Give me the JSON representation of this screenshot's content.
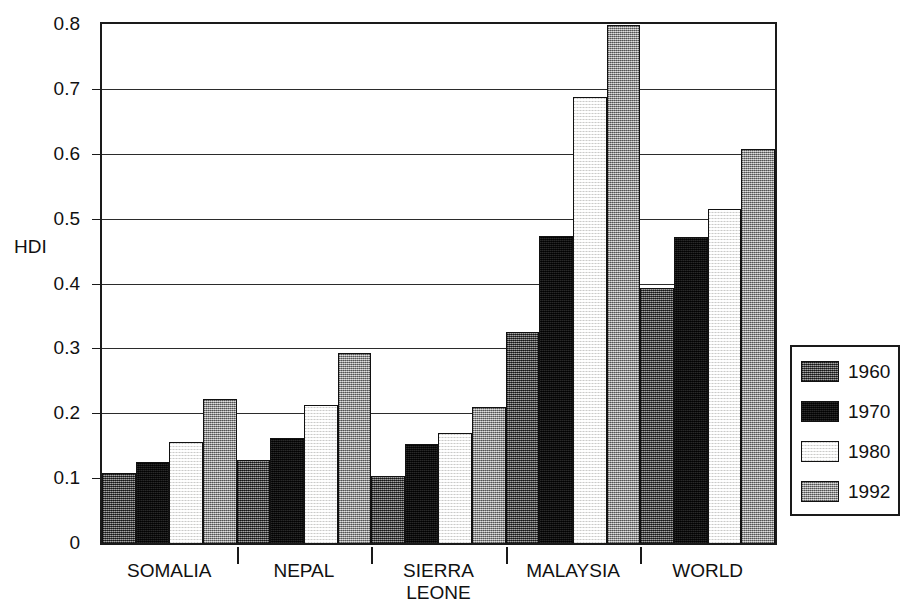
{
  "chart_data": {
    "type": "bar",
    "title": "",
    "xlabel": "",
    "ylabel": "HDI",
    "ylim": [
      0,
      0.8
    ],
    "ytick_labels": [
      "0.8",
      "0.7",
      "0.6",
      "0.5",
      "0.4",
      "0.3",
      "0.2",
      "0.1",
      "0"
    ],
    "ytick_values": [
      0.8,
      0.7,
      0.6,
      0.5,
      0.4,
      0.3,
      0.2,
      0.1,
      0
    ],
    "grid": true,
    "legend_position": "right-outside",
    "categories": [
      "SOMALIA",
      "NEPAL",
      "SIERRA LEONE",
      "MALAYSIA",
      "WORLD"
    ],
    "series": [
      {
        "name": "1960",
        "color": "#565656",
        "values": [
          0.108,
          0.128,
          0.103,
          0.325,
          0.393
        ]
      },
      {
        "name": "1970",
        "color": "#0d0d0d",
        "values": [
          0.125,
          0.162,
          0.152,
          0.473,
          0.472
        ]
      },
      {
        "name": "1980",
        "color": "#f2f2f0",
        "values": [
          0.155,
          0.212,
          0.17,
          0.688,
          0.515
        ]
      },
      {
        "name": "1992",
        "color": "#9d9d9d",
        "values": [
          0.222,
          0.293,
          0.21,
          0.798,
          0.607
        ]
      }
    ]
  },
  "axis": {
    "y_label": "HDI"
  },
  "categories_display": [
    {
      "line1": "SOMALIA",
      "line2": ""
    },
    {
      "line1": "NEPAL",
      "line2": ""
    },
    {
      "line1": "SIERRA",
      "line2": "LEONE"
    },
    {
      "line1": "MALAYSIA",
      "line2": ""
    },
    {
      "line1": "WORLD",
      "line2": ""
    }
  ],
  "legend": {
    "entries": [
      {
        "label": "1960",
        "swatch": "fill-1960"
      },
      {
        "label": "1970",
        "swatch": "fill-1970"
      },
      {
        "label": "1980",
        "swatch": "fill-1980"
      },
      {
        "label": "1992",
        "swatch": "fill-1992"
      }
    ]
  }
}
